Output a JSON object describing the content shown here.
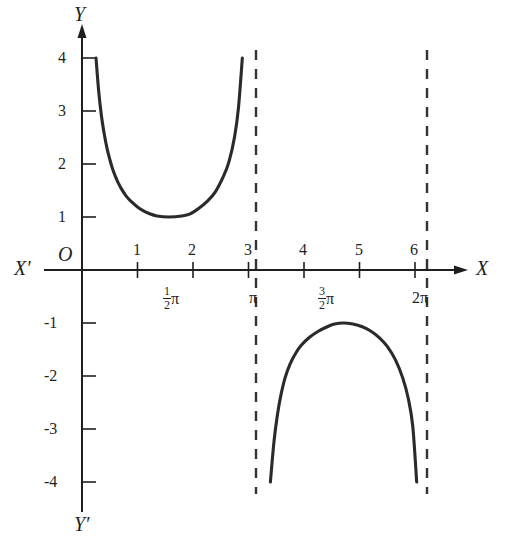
{
  "figure": {
    "background_color": "#ffffff",
    "curve_color": "#2a2a2a",
    "axis_color": "#1f1f1f",
    "dash_color": "#333333",
    "origin_label": "O",
    "axis_labels": {
      "x_positive": "X",
      "x_negative": "X′",
      "y_positive": "Y",
      "y_negative": "Y′"
    }
  },
  "chart_data": {
    "type": "line",
    "title": "",
    "xlabel": "X",
    "ylabel": "Y",
    "function": "y = csc x",
    "xlim": [
      0,
      6.6
    ],
    "ylim": [
      -4,
      4
    ],
    "grid": false,
    "legend": "none",
    "x_ticks": [
      1,
      2,
      3,
      4,
      5,
      6
    ],
    "x_tick_labels": [
      "1",
      "2",
      "3",
      "4",
      "5",
      "6"
    ],
    "y_ticks": [
      4,
      3,
      2,
      1,
      -1,
      -2,
      -3,
      -4
    ],
    "y_tick_labels": [
      "4",
      "3",
      "2",
      "1",
      "-1",
      "-2",
      "-3",
      "-4"
    ],
    "special_x_labels": [
      {
        "value": 1.5708,
        "label": "½π",
        "numerator": "1",
        "denominator": "2",
        "symbol": "π"
      },
      {
        "value": 3.1416,
        "label": "π",
        "numerator": "",
        "denominator": "",
        "symbol": "π"
      },
      {
        "value": 4.7124,
        "label": "3/2π",
        "numerator": "3",
        "denominator": "2",
        "symbol": "π"
      },
      {
        "value": 6.2832,
        "label": "2π",
        "numerator": "",
        "denominator": "",
        "symbol": "2π"
      }
    ],
    "asymptotes": [
      {
        "x": 3.1416,
        "label": "π",
        "style": "dashed"
      },
      {
        "x": 6.2832,
        "label": "2π",
        "style": "dashed"
      }
    ],
    "series": [
      {
        "name": "csc x (branch 1)",
        "x_range": [
          0.2527,
          2.8889
        ],
        "points": [
          [
            0.2527,
            4.0
          ],
          [
            0.3,
            3.38
          ],
          [
            0.35,
            2.91
          ],
          [
            0.4,
            2.57
          ],
          [
            0.45,
            2.3
          ],
          [
            0.5,
            2.09
          ],
          [
            0.55,
            1.91
          ],
          [
            0.6,
            1.77
          ],
          [
            0.65,
            1.65
          ],
          [
            0.7,
            1.55
          ],
          [
            0.8,
            1.39
          ],
          [
            0.9,
            1.28
          ],
          [
            1.0,
            1.19
          ],
          [
            1.1,
            1.12
          ],
          [
            1.2,
            1.07
          ],
          [
            1.35,
            1.02
          ],
          [
            1.5708,
            1.0
          ],
          [
            1.8,
            1.02
          ],
          [
            1.95,
            1.06
          ],
          [
            2.1,
            1.16
          ],
          [
            2.25,
            1.29
          ],
          [
            2.4,
            1.47
          ],
          [
            2.55,
            1.77
          ],
          [
            2.65,
            2.05
          ],
          [
            2.75,
            2.52
          ],
          [
            2.82,
            3.07
          ],
          [
            2.8889,
            4.0
          ]
        ]
      },
      {
        "name": "csc x (branch 2)",
        "x_range": [
          3.3943,
          6.0305
        ],
        "points": [
          [
            3.3943,
            -4.0
          ],
          [
            3.46,
            -3.23
          ],
          [
            3.52,
            -2.74
          ],
          [
            3.58,
            -2.38
          ],
          [
            3.66,
            -2.03
          ],
          [
            3.75,
            -1.77
          ],
          [
            3.85,
            -1.57
          ],
          [
            3.95,
            -1.42
          ],
          [
            4.1,
            -1.27
          ],
          [
            4.25,
            -1.16
          ],
          [
            4.4,
            -1.08
          ],
          [
            4.55,
            -1.02
          ],
          [
            4.7124,
            -1.0
          ],
          [
            4.88,
            -1.02
          ],
          [
            5.05,
            -1.07
          ],
          [
            5.2,
            -1.15
          ],
          [
            5.35,
            -1.27
          ],
          [
            5.5,
            -1.44
          ],
          [
            5.65,
            -1.7
          ],
          [
            5.78,
            -2.04
          ],
          [
            5.88,
            -2.43
          ],
          [
            5.96,
            -2.95
          ],
          [
            6.0305,
            -4.0
          ]
        ]
      }
    ]
  }
}
